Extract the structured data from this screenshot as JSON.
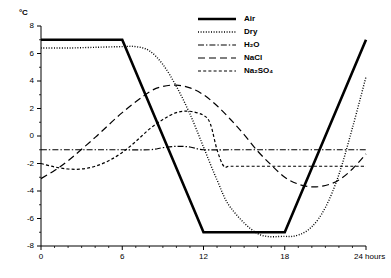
{
  "chart_data": {
    "type": "line",
    "title": "",
    "xlabel": "hours",
    "ylabel": "°C",
    "xlim": [
      0,
      24
    ],
    "ylim": [
      -8,
      8
    ],
    "grid": false,
    "legend_position": "top-right",
    "x_ticks": [
      "0",
      "6",
      "12",
      "18",
      "24"
    ],
    "x_tick_values": [
      0,
      6,
      12,
      18,
      24
    ],
    "x_minor_step": 1,
    "y_ticks": [
      "8",
      "6",
      "4",
      "2",
      "0",
      "-2",
      "-4",
      "-6",
      "-8"
    ],
    "y_tick_values": [
      8,
      6,
      4,
      2,
      0,
      -2,
      -4,
      -6,
      -8
    ],
    "y_minor_step": 1,
    "x_axis_unit_label": "24 hours",
    "series": [
      {
        "name": "Air",
        "style": "solid",
        "width": 2.6,
        "color": "#000000",
        "x": [
          0,
          6,
          12,
          18,
          24
        ],
        "values": [
          7,
          7,
          -7,
          -7,
          7
        ]
      },
      {
        "name": "Dry",
        "style": "dotted",
        "width": 1.4,
        "color": "#000000",
        "x": [
          0,
          2,
          4,
          6,
          7,
          8,
          9,
          10,
          11,
          12,
          13,
          14,
          16,
          18,
          19,
          20,
          21,
          22,
          23,
          24
        ],
        "values": [
          6.4,
          6.4,
          6.45,
          6.5,
          6.5,
          6.2,
          5.2,
          3.6,
          1.6,
          -0.8,
          -3.2,
          -5.2,
          -7.1,
          -7.3,
          -7.2,
          -6.6,
          -5.2,
          -2.8,
          0.6,
          4.3
        ]
      },
      {
        "name": "H₂O",
        "style": "dashdot",
        "width": 1.2,
        "color": "#000000",
        "x": [
          0,
          2,
          4,
          6,
          8,
          9,
          10,
          11,
          12,
          14,
          16,
          18,
          20,
          22,
          24
        ],
        "values": [
          -1,
          -1,
          -1,
          -1,
          -1,
          -0.85,
          -0.75,
          -0.8,
          -1,
          -1,
          -1,
          -1,
          -1,
          -1,
          -1
        ]
      },
      {
        "name": "NaCl",
        "style": "longdash",
        "width": 1.2,
        "color": "#000000",
        "x": [
          0,
          1,
          2,
          4,
          6,
          8,
          9,
          10,
          11,
          12,
          13,
          14,
          15,
          16,
          17,
          18,
          19,
          20,
          21,
          22,
          23,
          24
        ],
        "values": [
          -3.1,
          -2.5,
          -1.8,
          -0.1,
          1.7,
          3.2,
          3.6,
          3.7,
          3.5,
          3.0,
          2.2,
          1.2,
          0.1,
          -1.1,
          -2.1,
          -3.0,
          -3.5,
          -3.7,
          -3.6,
          -3.2,
          -2.4,
          -1.3
        ]
      },
      {
        "name": "Na₂SO₄",
        "style": "shortdash",
        "width": 1.2,
        "color": "#000000",
        "x": [
          0,
          1,
          2,
          3,
          4,
          5,
          6,
          7,
          8,
          9,
          10,
          11,
          12,
          12.5,
          13,
          13.5,
          14,
          16,
          18,
          20,
          22,
          24
        ],
        "values": [
          -2.0,
          -2.25,
          -2.4,
          -2.4,
          -2.2,
          -1.8,
          -1.2,
          -0.4,
          0.5,
          1.2,
          1.7,
          1.8,
          1.5,
          0.9,
          -1.0,
          -2.2,
          -2.2,
          -2.2,
          -2.2,
          -2.2,
          -2.2,
          -2.2
        ]
      }
    ]
  },
  "legend": {
    "items": [
      {
        "label": "Air",
        "style": "solid"
      },
      {
        "label": "Dry",
        "style": "dotted"
      },
      {
        "label": "H₂O",
        "style": "dashdot"
      },
      {
        "label": "NaCl",
        "style": "longdash"
      },
      {
        "label": "Na₂SO₄",
        "style": "shortdash"
      }
    ]
  }
}
